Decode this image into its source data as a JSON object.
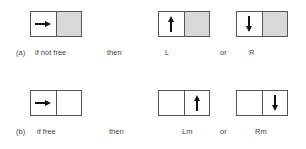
{
  "rows": [
    {
      "label": "(a)",
      "condition": "if not free",
      "then": "then",
      "result1": "L",
      "or": "or",
      "result2": "R",
      "input_box": {
        "left": "arrow-right",
        "right": "shaded"
      },
      "box1": {
        "left": "arrow-up",
        "right": "shaded"
      },
      "box2": {
        "left": "arrow-down",
        "right": "shaded"
      }
    },
    {
      "label": "(b)",
      "condition": "if free",
      "then": "then",
      "result1": "Lm",
      "or": "or",
      "result2": "Rm",
      "input_box": {
        "left": "arrow-right",
        "right": "empty"
      },
      "box1": {
        "left": "empty",
        "right": "arrow-up"
      },
      "box2": {
        "left": "empty",
        "right": "arrow-down"
      }
    }
  ],
  "colors": {
    "shade": "#d9d9d9",
    "line": "#555555",
    "arrow": "#111111"
  }
}
